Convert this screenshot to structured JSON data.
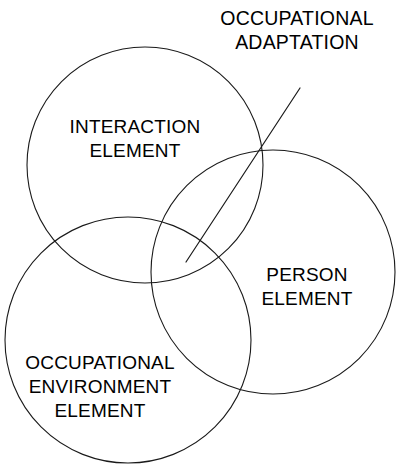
{
  "diagram": {
    "type": "venn",
    "title": {
      "lines": [
        "OCCUPATIONAL",
        "ADAPTATION"
      ],
      "line1": "OCCUPATIONAL",
      "line2": "ADAPTATION",
      "x": 297,
      "y1": 20,
      "y2": 44
    },
    "background_color": "#ffffff",
    "stroke_color": "#1a1a1a",
    "text_color": "#000000",
    "circles": [
      {
        "id": "interaction",
        "label_lines": [
          "INTERACTION",
          "ELEMENT"
        ],
        "line1": "INTERACTION",
        "line2": "ELEMENT",
        "cx": 145,
        "cy": 165,
        "r": 118,
        "label_x": 135,
        "label_y1": 128,
        "label_y2": 152
      },
      {
        "id": "person",
        "label_lines": [
          "PERSON",
          "ELEMENT"
        ],
        "line1": "PERSON",
        "line2": "ELEMENT",
        "cx": 273,
        "cy": 272,
        "r": 122,
        "label_x": 307,
        "label_y1": 276,
        "label_y2": 300
      },
      {
        "id": "occupational-environment",
        "label_lines": [
          "OCCUPATIONAL",
          "ENVIRONMENT",
          "ELEMENT"
        ],
        "line1": "OCCUPATIONAL",
        "line2": "ENVIRONMENT",
        "line3": "ELEMENT",
        "cx": 128,
        "cy": 340,
        "r": 123,
        "label_x": 100,
        "label_y1": 364,
        "label_y2": 388,
        "label_y3": 412
      }
    ],
    "leader_line": {
      "label": "occupational-adaptation-pointer",
      "x1": 300,
      "y1": 88,
      "x2": 186,
      "y2": 262,
      "points_to": "triple-intersection-region"
    }
  }
}
